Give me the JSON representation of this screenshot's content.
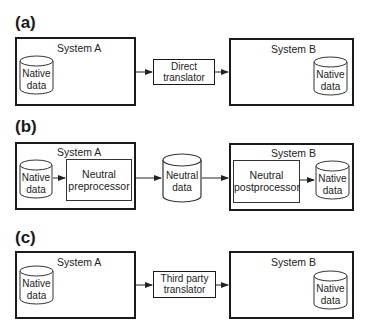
{
  "panels": [
    {
      "id": "a",
      "label": "(a)",
      "system_a": {
        "title": "System A",
        "store": {
          "line1": "Native",
          "line2": "data"
        }
      },
      "middle": {
        "line1": "Direct",
        "line2": "translator"
      },
      "system_b": {
        "title": "System B",
        "store": {
          "line1": "Native",
          "line2": "data"
        }
      }
    },
    {
      "id": "b",
      "label": "(b)",
      "system_a": {
        "title": "System A",
        "store": {
          "line1": "Native",
          "line2": "data"
        },
        "processor": {
          "line1": "Neutral",
          "line2": "preprocessor"
        }
      },
      "middle": {
        "line1": "Neutral",
        "line2": "data"
      },
      "system_b": {
        "title": "System B",
        "store": {
          "line1": "Native",
          "line2": "data"
        },
        "processor": {
          "line1": "Neutral",
          "line2": "postprocessor"
        }
      }
    },
    {
      "id": "c",
      "label": "(c)",
      "system_a": {
        "title": "System A",
        "store": {
          "line1": "Native",
          "line2": "data"
        }
      },
      "middle": {
        "line1": "Third party",
        "line2": "translator"
      },
      "system_b": {
        "title": "System B",
        "store": {
          "line1": "Native",
          "line2": "data"
        }
      }
    }
  ],
  "colors": {
    "stroke": "#1a1a1a",
    "background": "#ffffff"
  }
}
